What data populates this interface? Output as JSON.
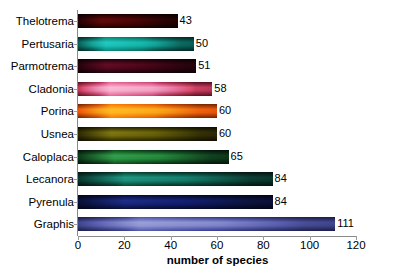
{
  "chart_data": {
    "type": "bar",
    "orientation": "horizontal",
    "title": "",
    "xlabel": "number of species",
    "ylabel": "",
    "xlim": [
      0,
      120
    ],
    "xticks": [
      0,
      20,
      40,
      60,
      80,
      100,
      120
    ],
    "grid": false,
    "legend": null,
    "categories": [
      "Thelotrema",
      "Pertusaria",
      "Parmotrema",
      "Cladonia",
      "Porina",
      "Usnea",
      "Caloplaca",
      "Lecanora",
      "Pyrenula",
      "Graphis"
    ],
    "values": [
      43,
      50,
      51,
      58,
      60,
      60,
      65,
      84,
      84,
      111
    ],
    "value_labels": [
      "43",
      "50",
      "51",
      "58",
      "60",
      "60",
      "65",
      "84",
      "84",
      "111"
    ],
    "bar_colors": [
      "#5e1412",
      "#2f9a93",
      "#5e1634",
      "#d58fa4",
      "#e59234",
      "#6e6a1c",
      "#3f7f52",
      "#2d7a70",
      "#2b3a72",
      "#7c7fa8"
    ],
    "bar_edge_colors": [
      "#2a0706",
      "#134a47",
      "#2c0a18",
      "#6b2d40",
      "#7a4610",
      "#2f2d0b",
      "#153423",
      "#12342f",
      "#151c38",
      "#3c3f63"
    ]
  },
  "axis": {
    "x_tick_labels": [
      "0",
      "20",
      "40",
      "60",
      "80",
      "100",
      "120"
    ],
    "x_title": "number of species"
  }
}
